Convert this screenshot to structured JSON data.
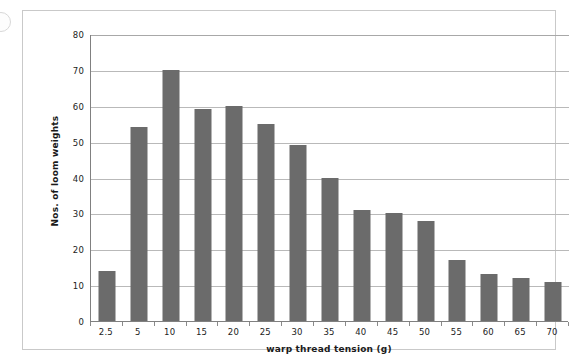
{
  "chart_data": {
    "type": "bar",
    "title": "",
    "xlabel": "warp thread tension (g)",
    "ylabel": "Nos. of loom weights",
    "categories": [
      "2.5",
      "5",
      "10",
      "15",
      "20",
      "25",
      "30",
      "35",
      "40",
      "45",
      "50",
      "55",
      "60",
      "65",
      "70"
    ],
    "values": [
      14,
      54,
      70,
      59,
      60,
      55,
      49,
      40,
      31,
      30,
      28,
      17,
      13,
      12,
      11
    ],
    "ylim": [
      0,
      80
    ],
    "yticks": [
      0,
      10,
      20,
      30,
      40,
      50,
      60,
      70,
      80
    ],
    "ytick_labels": [
      "0",
      "10",
      "20",
      "30",
      "40",
      "50",
      "60",
      "70",
      "80"
    ],
    "grid": "horizontal",
    "legend": "none",
    "bar_color": "#6b6b6b",
    "gridline_color": "#b9b9b9",
    "axis_color": "#808080",
    "frame_color": "#c9c9c9",
    "background_color": "#ffffff"
  }
}
